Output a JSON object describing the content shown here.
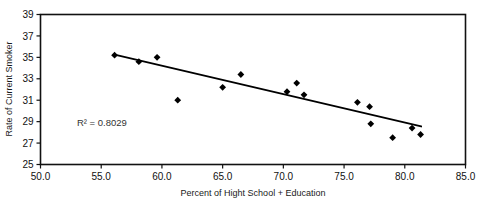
{
  "chart_data": {
    "type": "scatter",
    "title": "",
    "xlabel": "Percent of Hight School + Education",
    "ylabel": "Rate of Current Smoker",
    "xlim": [
      50.0,
      85.0
    ],
    "ylim": [
      25,
      39
    ],
    "xticks": [
      "50.0",
      "55.0",
      "60.0",
      "65.0",
      "70.0",
      "75.0",
      "80.0",
      "85.0"
    ],
    "xtick_values": [
      50.0,
      55.0,
      60.0,
      65.0,
      70.0,
      75.0,
      80.0,
      85.0
    ],
    "yticks": [
      "25",
      "27",
      "29",
      "31",
      "33",
      "35",
      "37",
      "39"
    ],
    "ytick_values": [
      25,
      27,
      29,
      31,
      33,
      35,
      37,
      39
    ],
    "grid": false,
    "legend": false,
    "annotations": [
      {
        "name": "r-squared",
        "text": "R² = 0.8029",
        "x": 53.0,
        "y": 28.6
      }
    ],
    "series": [
      {
        "name": "States",
        "marker": "diamond",
        "color": "#000000",
        "points": [
          {
            "x": 56.1,
            "y": 35.2
          },
          {
            "x": 58.1,
            "y": 34.6
          },
          {
            "x": 59.6,
            "y": 35.0
          },
          {
            "x": 61.3,
            "y": 31.0
          },
          {
            "x": 65.0,
            "y": 32.2
          },
          {
            "x": 66.5,
            "y": 33.4
          },
          {
            "x": 70.3,
            "y": 31.8
          },
          {
            "x": 71.1,
            "y": 32.6
          },
          {
            "x": 71.7,
            "y": 31.5
          },
          {
            "x": 76.1,
            "y": 30.8
          },
          {
            "x": 77.1,
            "y": 30.4
          },
          {
            "x": 77.2,
            "y": 28.8
          },
          {
            "x": 79.0,
            "y": 27.5
          },
          {
            "x": 80.6,
            "y": 28.4
          },
          {
            "x": 81.3,
            "y": 27.8
          }
        ]
      }
    ],
    "trendline": {
      "name": "linear-fit",
      "color": "#000000",
      "x_start": 56.1,
      "y_start": 35.25,
      "x_end": 81.35,
      "y_end": 28.55,
      "r_squared": 0.8029
    }
  }
}
